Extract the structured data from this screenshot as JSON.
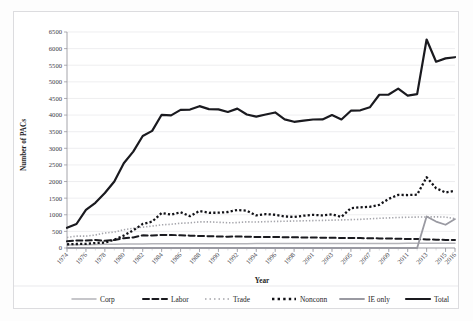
{
  "chart_data": {
    "type": "line",
    "title": "",
    "xlabel": "Year",
    "ylabel": "Number of PACs",
    "ylim": [
      0,
      6500
    ],
    "ytick_step": 500,
    "grid": true,
    "legend_position": "bottom",
    "yticks": [
      0,
      500,
      1000,
      1500,
      2000,
      2500,
      3000,
      3500,
      4000,
      4500,
      5000,
      5500,
      6000,
      6500
    ],
    "ytick_labels": [
      "0",
      "500",
      "1000",
      "1500",
      "2000",
      "2500",
      "3000",
      "3500",
      "4000",
      "4500",
      "5000",
      "5500",
      "6000",
      "6500"
    ],
    "categories": [
      "1974",
      "1975",
      "1976",
      "1977",
      "1978",
      "1979",
      "1980",
      "1981",
      "1982",
      "1983",
      "1984",
      "1985",
      "1986",
      "1987",
      "1988",
      "1989",
      "1990",
      "1991",
      "1992",
      "1993",
      "1994",
      "1995",
      "1996",
      "1997",
      "1998",
      "1999",
      "2001",
      "2002",
      "2003",
      "2004",
      "2005",
      "2006",
      "2007",
      "2008",
      "2009",
      "2010",
      "2011",
      "2012",
      "2013",
      "2014",
      "2015",
      "2016"
    ],
    "xtick_labels": [
      "1974",
      "1976",
      "1978",
      "1980",
      "1982",
      "1984",
      "1986",
      "1988",
      "1990",
      "1992",
      "1994",
      "1996",
      "1998",
      "2001",
      "2003",
      "2005",
      "2007",
      "2009",
      "2011",
      "2013",
      "2015",
      "2016"
    ],
    "xtick_indices": [
      0,
      2,
      4,
      6,
      8,
      10,
      12,
      14,
      16,
      18,
      20,
      22,
      24,
      26,
      28,
      30,
      32,
      34,
      36,
      38,
      40,
      41
    ],
    "series": [
      {
        "name": "Corp",
        "style": "solid",
        "color": "#b4b4b9",
        "width": 1.5,
        "values": [
          89,
          95,
          100,
          105,
          110,
          115,
          120,
          122,
          124,
          125,
          126,
          127,
          128,
          128,
          129,
          129,
          130,
          130,
          131,
          131,
          132,
          132,
          133,
          133,
          134,
          134,
          135,
          135,
          136,
          136,
          137,
          137,
          138,
          138,
          139,
          139,
          140,
          140,
          141,
          141,
          142,
          142
        ]
      },
      {
        "name": "Labor",
        "style": "dashed",
        "color": "#1a1a1f",
        "width": 2.0,
        "values": [
          201,
          225,
          224,
          240,
          217,
          240,
          297,
          318,
          380,
          378,
          394,
          390,
          385,
          372,
          361,
          356,
          346,
          341,
          347,
          337,
          333,
          334,
          332,
          325,
          321,
          318,
          316,
          311,
          307,
          302,
          301,
          299,
          293,
          289,
          286,
          278,
          272,
          269,
          259,
          250,
          244,
          240
        ]
      },
      {
        "name": "Trade",
        "style": "dotted-fine",
        "color": "#a5a5ab",
        "width": 1.6,
        "values": [
          318,
          357,
          356,
          392,
          452,
          477,
          551,
          594,
          628,
          660,
          698,
          714,
          745,
          757,
          786,
          787,
          774,
          760,
          763,
          787,
          782,
          793,
          800,
          805,
          812,
          818,
          825,
          830,
          838,
          845,
          853,
          862,
          880,
          893,
          906,
          918,
          925,
          931,
          935,
          938,
          930,
          885
        ]
      },
      {
        "name": "Nonconn",
        "style": "dotted-bold",
        "color": "#121217",
        "width": 2.3,
        "values": [
          110,
          120,
          125,
          150,
          162,
          250,
          374,
          531,
          723,
          794,
          1053,
          1003,
          1077,
          957,
          1115,
          1060,
          1062,
          1083,
          1145,
          1121,
          980,
          1020,
          1000,
          950,
          935,
          972,
          998,
          980,
          1010,
          935,
          1200,
          1225,
          1240,
          1300,
          1480,
          1597,
          1594,
          1604,
          2128,
          1800,
          1670,
          1720
        ]
      },
      {
        "name": "IE only",
        "style": "solid",
        "color": "#9a9aa2",
        "width": 1.8,
        "values": [
          0,
          0,
          0,
          0,
          0,
          0,
          0,
          0,
          0,
          0,
          0,
          0,
          0,
          0,
          0,
          0,
          0,
          0,
          0,
          0,
          0,
          0,
          0,
          0,
          0,
          0,
          0,
          0,
          0,
          0,
          0,
          0,
          0,
          0,
          0,
          0,
          0,
          0,
          950,
          795,
          700,
          870
        ]
      },
      {
        "name": "Total",
        "style": "solid",
        "color": "#1a1a1f",
        "width": 2.2,
        "values": [
          608,
          722,
          1146,
          1360,
          1653,
          2000,
          2551,
          2901,
          3371,
          3525,
          4009,
          3992,
          4157,
          4165,
          4268,
          4178,
          4172,
          4094,
          4195,
          4016,
          3954,
          4016,
          4079,
          3871,
          3798,
          3835,
          3867,
          3868,
          3999,
          3868,
          4131,
          4143,
          4234,
          4611,
          4618,
          4795,
          4586,
          4631,
          6274,
          5605,
          5707,
          5741
        ]
      }
    ]
  },
  "legend": {
    "items": [
      {
        "label": "Corp",
        "swatch": "solid-gray"
      },
      {
        "label": "Labor",
        "swatch": "solid-dark"
      },
      {
        "label": "Trade",
        "swatch": "dotted-gray"
      },
      {
        "label": "Nonconn",
        "swatch": "dotted-black"
      },
      {
        "label": "IE only",
        "swatch": "solid-midgray"
      },
      {
        "label": "Total",
        "swatch": "solid-black"
      }
    ]
  },
  "colors": {
    "corp": "#b4b4b9",
    "labor": "#1a1a1f",
    "trade": "#a5a5ab",
    "nonconn": "#121217",
    "ie_only": "#9a9aa2",
    "total": "#1a1a1f",
    "grid": "#e6e6ea",
    "axis": "#8d8d95"
  }
}
